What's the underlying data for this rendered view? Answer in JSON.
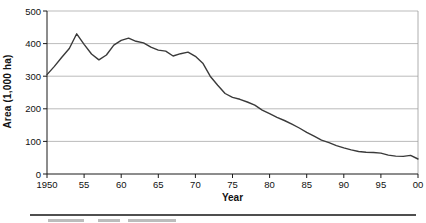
{
  "colors": {
    "line": "#3a3a3a",
    "grid": "#a9a9a9",
    "axis": "#1a1a1a",
    "frame": "#9a9a9a",
    "text": "#111111",
    "background": "#ffffff"
  },
  "footer": {
    "separator": true,
    "clipped_caption_visible": true
  },
  "chart_data": {
    "type": "line",
    "title": "",
    "xlabel": "Year",
    "ylabel": "Area (1,000 ha)",
    "x_start": 1950,
    "x_end": 2000,
    "x_step": 1,
    "ylim": [
      0,
      500
    ],
    "y_ticks": [
      0,
      100,
      200,
      300,
      400,
      500
    ],
    "x_ticks": [
      {
        "year": 1950,
        "label": "1950"
      },
      {
        "year": 1955,
        "label": "55"
      },
      {
        "year": 1960,
        "label": "60"
      },
      {
        "year": 1965,
        "label": "65"
      },
      {
        "year": 1970,
        "label": "70"
      },
      {
        "year": 1975,
        "label": "75"
      },
      {
        "year": 1980,
        "label": "80"
      },
      {
        "year": 1985,
        "label": "85"
      },
      {
        "year": 1990,
        "label": "90"
      },
      {
        "year": 1995,
        "label": "95"
      },
      {
        "year": 2000,
        "label": "00"
      }
    ],
    "grid": "horizontal",
    "legend": "none",
    "series": [
      {
        "name": "Area",
        "x": [
          1950,
          1951,
          1952,
          1953,
          1954,
          1955,
          1956,
          1957,
          1958,
          1959,
          1960,
          1961,
          1962,
          1963,
          1964,
          1965,
          1966,
          1967,
          1968,
          1969,
          1970,
          1971,
          1972,
          1973,
          1974,
          1975,
          1976,
          1977,
          1978,
          1979,
          1980,
          1981,
          1982,
          1983,
          1984,
          1985,
          1986,
          1987,
          1988,
          1989,
          1990,
          1991,
          1992,
          1993,
          1994,
          1995,
          1996,
          1997,
          1998,
          1999,
          2000
        ],
        "values": [
          305,
          330,
          358,
          385,
          430,
          398,
          368,
          350,
          365,
          395,
          410,
          417,
          407,
          402,
          389,
          380,
          377,
          362,
          369,
          374,
          361,
          340,
          300,
          272,
          247,
          235,
          229,
          221,
          211,
          196,
          185,
          174,
          164,
          153,
          141,
          128,
          116,
          104,
          96,
          87,
          80,
          74,
          69,
          67,
          66,
          64,
          58,
          55,
          54,
          57,
          46
        ]
      }
    ]
  }
}
